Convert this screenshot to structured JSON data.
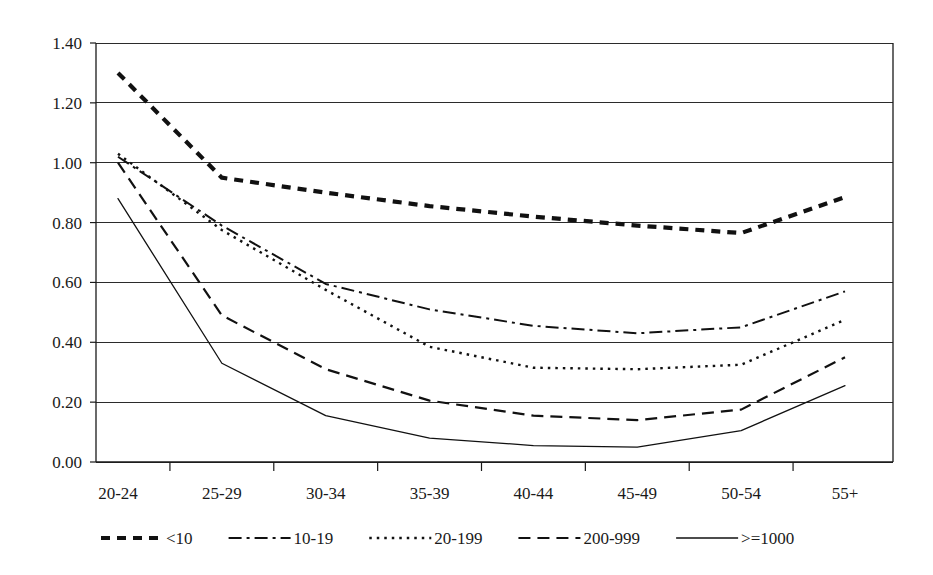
{
  "chart_data": {
    "type": "line",
    "title": "",
    "subtitle": "",
    "xlabel": "",
    "ylabel": "",
    "categories": [
      "20-24",
      "25-29",
      "30-34",
      "35-39",
      "40-44",
      "45-49",
      "50-54",
      "55+"
    ],
    "ylim": [
      0.0,
      1.4
    ],
    "ytick_step": 0.2,
    "ytick_labels": [
      "0.00",
      "0.20",
      "0.40",
      "0.60",
      "0.80",
      "1.00",
      "1.20",
      "1.40"
    ],
    "ytick_values": [
      0.0,
      0.2,
      0.4,
      0.6,
      0.8,
      1.0,
      1.2,
      1.4
    ],
    "grid": true,
    "grid_axis": "y",
    "legend_position": "bottom",
    "series": [
      {
        "name": "<10",
        "style": "thick-dashed",
        "dasharray": "9,7",
        "width": 4.2,
        "color": "#111111",
        "values": [
          1.3,
          0.95,
          0.9,
          0.855,
          0.82,
          0.79,
          0.765,
          0.885
        ]
      },
      {
        "name": "10-19",
        "style": "dash-dot",
        "dasharray": "13,5,3,5",
        "width": 2.0,
        "color": "#111111",
        "values": [
          1.02,
          0.79,
          0.595,
          0.51,
          0.455,
          0.43,
          0.45,
          0.57
        ]
      },
      {
        "name": "20-199",
        "style": "dotted",
        "dasharray": "2.5,5",
        "width": 2.4,
        "color": "#111111",
        "values": [
          1.03,
          0.775,
          0.575,
          0.385,
          0.315,
          0.31,
          0.325,
          0.475
        ]
      },
      {
        "name": "200-999",
        "style": "dashed",
        "dasharray": "12,7",
        "width": 2.2,
        "color": "#111111",
        "values": [
          1.0,
          0.49,
          0.31,
          0.205,
          0.155,
          0.14,
          0.175,
          0.35
        ]
      },
      {
        "name": ">=1000",
        "style": "solid",
        "dasharray": "none",
        "width": 1.3,
        "color": "#111111",
        "values": [
          0.88,
          0.33,
          0.155,
          0.08,
          0.055,
          0.05,
          0.105,
          0.255
        ]
      }
    ]
  },
  "legend": {
    "entries": [
      {
        "label": "<10"
      },
      {
        "label": "10-19"
      },
      {
        "label": "20-199"
      },
      {
        "label": "200-999"
      },
      {
        "label": ">=1000"
      }
    ]
  },
  "colors": {
    "ink": "#111111",
    "grid": "#2b2b2b",
    "background": "#ffffff"
  }
}
